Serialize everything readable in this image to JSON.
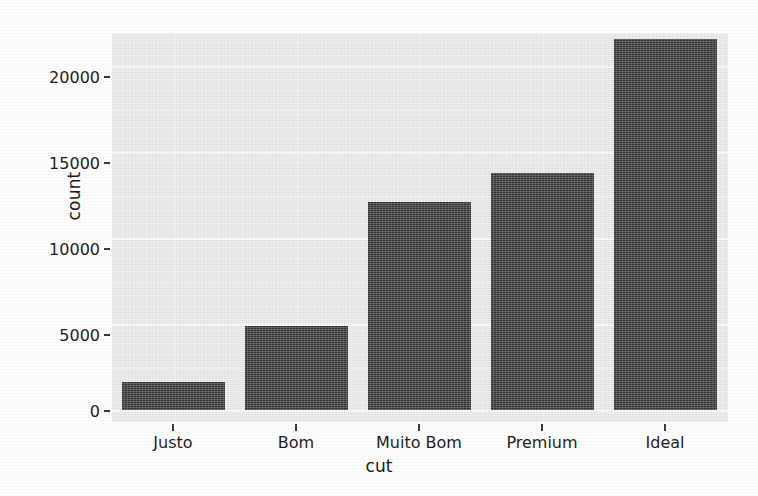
{
  "chart_data": {
    "type": "bar",
    "title": "",
    "subtitle": "",
    "xlabel": "cut",
    "ylabel": "count",
    "categories": [
      "Justo",
      "Bom",
      "Muito Bom",
      "Premium",
      "Ideal"
    ],
    "values": [
      1610,
      4900,
      12080,
      13790,
      21550
    ],
    "series": [
      {
        "name": "count",
        "values": [
          1610,
          4900,
          12080,
          13790,
          21550
        ]
      }
    ],
    "ylim": [
      0,
      22450
    ],
    "yticks": [
      0,
      5000,
      10000,
      15000,
      20000
    ],
    "ytick_labels": [
      "0",
      "5000",
      "10000",
      "15000",
      "20000"
    ],
    "grid": true,
    "grid_major_color": "#fbfbfb",
    "grid_minor_color": "#f4f4f4",
    "legend": "none",
    "legend_position": "none",
    "bar_color": "#363636",
    "panel_background": "#ebebeb",
    "figure_background": "#fdfdfd",
    "axis_text_color": "#1f1f1f"
  },
  "axes": {
    "y_title": "count",
    "x_title": "cut",
    "y_tick_labels": [
      "20000",
      "15000",
      "10000",
      "5000",
      "0"
    ],
    "x_tick_labels": [
      "Justo",
      "Bom",
      "Muito Bom",
      "Premium",
      "Ideal"
    ]
  }
}
